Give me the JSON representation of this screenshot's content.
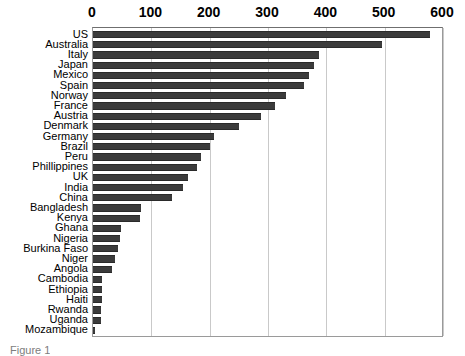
{
  "chart_data": {
    "type": "bar",
    "orientation": "horizontal",
    "title": "",
    "xlabel": "",
    "ylabel": "",
    "xlim": [
      0,
      600
    ],
    "ylim": null,
    "grid": true,
    "legend": null,
    "axis_position": "top",
    "tick_labels": [
      "0",
      "100",
      "200",
      "300",
      "400",
      "500",
      "600"
    ],
    "ticks": [
      0,
      100,
      200,
      300,
      400,
      500,
      600
    ],
    "bar_color": "#3b3b3b",
    "gridline_color": "#c9c9c9",
    "categories": [
      "US",
      "Australia",
      "Italy",
      "Japan",
      "Mexico",
      "Spain",
      "Norway",
      "France",
      "Austria",
      "Denmark",
      "Germany",
      "Brazil",
      "Peru",
      "Phillippines",
      "UK",
      "India",
      "China",
      "Bangladesh",
      "Kenya",
      "Ghana",
      "Nigeria",
      "Burkina Faso",
      "Niger",
      "Angola",
      "Cambodia",
      "Ethiopia",
      "Haiti",
      "Rwanda",
      "Uganda",
      "Mozambique"
    ],
    "values": [
      578,
      495,
      388,
      378,
      370,
      362,
      330,
      312,
      288,
      250,
      208,
      200,
      185,
      178,
      162,
      155,
      136,
      83,
      80,
      48,
      46,
      42,
      38,
      33,
      16,
      15,
      15,
      14,
      14,
      3
    ]
  },
  "caption": {
    "text": "Figure 1"
  }
}
